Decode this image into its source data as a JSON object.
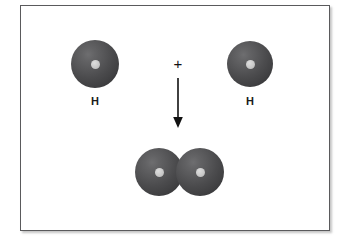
{
  "diagram": {
    "frame": {
      "border_color": "#5a5a5c",
      "background_color": "#ffffff"
    },
    "reactants": [
      {
        "id": "atom-h-left",
        "label": "H",
        "element": "hydrogen",
        "sphere_color": "#4b4b4d",
        "nucleus_color": "#c9c9c9"
      },
      {
        "id": "atom-h-right",
        "label": "H",
        "element": "hydrogen",
        "sphere_color": "#4b4b4d",
        "nucleus_color": "#c9c9c9"
      }
    ],
    "operator": {
      "symbol": "+",
      "name": "plus-sign",
      "color": "#111111"
    },
    "reaction_arrow": {
      "direction": "down",
      "name": "down-arrow",
      "color": "#111111"
    },
    "product": {
      "id": "molecule-h2",
      "formula": "H2",
      "label": "",
      "atom_count": 2,
      "atoms": [
        {
          "id": "mol-atom-left",
          "element": "hydrogen",
          "sphere_color": "#4b4b4d",
          "nucleus_color": "#c9c9c9"
        },
        {
          "id": "mol-atom-right",
          "element": "hydrogen",
          "sphere_color": "#4b4b4d",
          "nucleus_color": "#c9c9c9"
        }
      ]
    }
  }
}
